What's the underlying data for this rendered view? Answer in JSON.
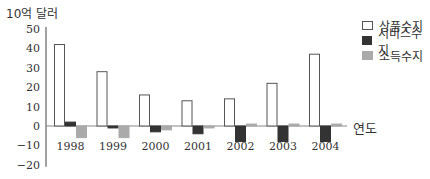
{
  "chart_data": {
    "type": "bar",
    "title": "",
    "ylabel": "10억 달러",
    "xlabel": "연도",
    "ylim": [
      -20,
      50
    ],
    "yticks": [
      50,
      40,
      30,
      20,
      10,
      0,
      -10,
      -20
    ],
    "categories": [
      "1998",
      "1999",
      "2000",
      "2001",
      "2002",
      "2003",
      "2004"
    ],
    "series": [
      {
        "name": "상품수지",
        "color": "#ffffff",
        "stroke": "#555555",
        "values": [
          42,
          28,
          16,
          13,
          14,
          22,
          37
        ]
      },
      {
        "name": "서비스수지",
        "color": "#333333",
        "stroke": "#333333",
        "values": [
          2,
          -1,
          -3,
          -4,
          -8,
          -8,
          -8
        ]
      },
      {
        "name": "소득수지",
        "color": "#aaaaaa",
        "stroke": "#aaaaaa",
        "values": [
          -6,
          -6,
          -2,
          -1,
          1,
          1,
          1
        ]
      }
    ],
    "legend_position": "top-right",
    "grid": false
  },
  "labels": {
    "unit": "10억 달러",
    "xaxis": "연도",
    "legend": [
      "상품수지",
      "서비스수지",
      "소득수지"
    ]
  }
}
